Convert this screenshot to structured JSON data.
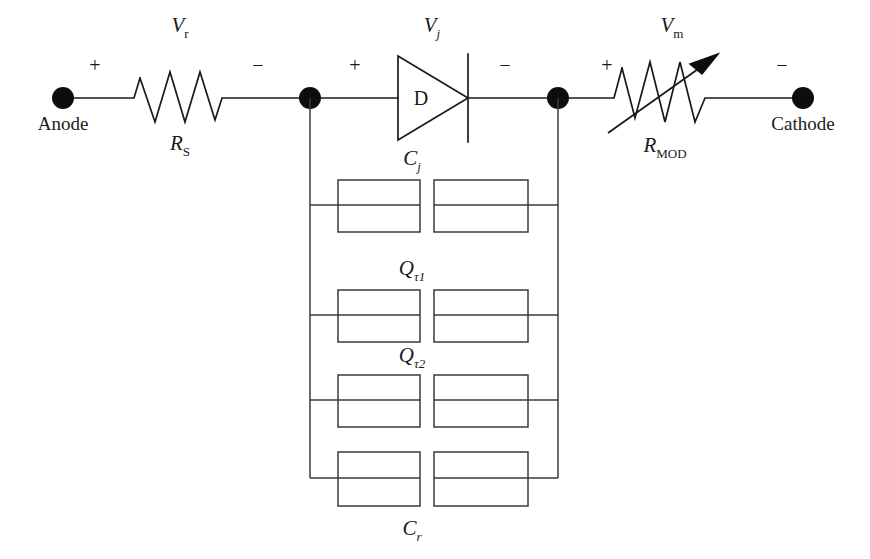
{
  "figure": {
    "type": "circuit-schematic",
    "title": ""
  },
  "terminals": {
    "anode_label": "Anode",
    "cathode_label": "Cathode"
  },
  "components": {
    "series_resistor": {
      "name": "R",
      "subscript": "S",
      "voltage": "V",
      "voltage_subscript": "r",
      "type": "resistor"
    },
    "diode": {
      "name": "D",
      "voltage": "V",
      "voltage_subscript": "j",
      "type": "diode"
    },
    "mod_resistor": {
      "name": "R",
      "subscript": "MOD",
      "voltage": "V",
      "voltage_subscript": "m",
      "type": "variable-resistor"
    },
    "branches": [
      {
        "name": "C",
        "subscript": "j",
        "label_position": "above",
        "type": "capacitor"
      },
      {
        "name": "Q",
        "subscript": "τ1",
        "label_position": "above",
        "type": "capacitor"
      },
      {
        "name": "Q",
        "subscript": "τ2",
        "label_position": "above",
        "type": "capacitor"
      },
      {
        "name": "C",
        "subscript": "r",
        "label_position": "below",
        "type": "capacitor"
      }
    ]
  },
  "polarity_marks": [
    {
      "sign": "+",
      "for": "series_resistor"
    },
    {
      "sign": "−",
      "for": "series_resistor"
    },
    {
      "sign": "+",
      "for": "diode"
    },
    {
      "sign": "−",
      "for": "diode"
    },
    {
      "sign": "+",
      "for": "mod_resistor"
    },
    {
      "sign": "−",
      "for": "mod_resistor"
    }
  ],
  "colors": {
    "line": "#1a1a1a",
    "box_line": "#3a3a3a",
    "background": "#ffffff"
  }
}
